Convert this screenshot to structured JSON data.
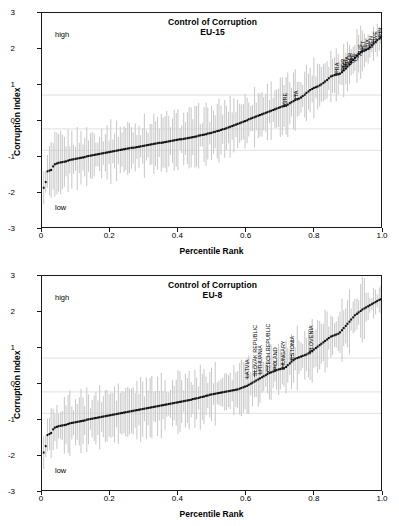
{
  "figure": {
    "width": 399,
    "height": 526,
    "background": "#ffffff",
    "marker_color": "#101010",
    "errorbar_color": "#c9c9c9",
    "grid_color": "#d8d8d8",
    "axis_color": "#1a1a1a"
  },
  "panels": [
    {
      "id": "eu15",
      "title_line1": "Control of Corruption",
      "title_line2": "EU-15",
      "note_high": "high",
      "note_low": "low",
      "xlabel": "Percentile Rank",
      "ylabel": "Corruption Index",
      "xticks": [
        "0",
        "0.2",
        "0.4",
        "0.6",
        "0.8",
        "1.0"
      ],
      "yticks": [
        "3",
        "2",
        "1",
        "0",
        "-1",
        "-2",
        "-3"
      ]
    },
    {
      "id": "eu8",
      "title_line1": "Control of Corruption",
      "title_line2": "EU-8",
      "note_high": "high",
      "note_low": "low",
      "xlabel": "Percentile Rank",
      "ylabel": "Corruption Index",
      "xticks": [
        "0",
        "0.2",
        "0.4",
        "0.6",
        "0.8",
        "1.0"
      ],
      "yticks": [
        "3",
        "2",
        "1",
        "0",
        "-1",
        "-2",
        "-3"
      ]
    }
  ],
  "chart_data": [
    {
      "type": "scatter",
      "id": "eu15",
      "title": "Control of Corruption EU-15",
      "xlabel": "Percentile Rank",
      "ylabel": "Corruption Index",
      "xlim": [
        0.0,
        1.0
      ],
      "ylim": [
        -3,
        3
      ],
      "xticks": [
        0,
        0.2,
        0.4,
        0.6,
        0.8,
        1.0
      ],
      "yticks": [
        3,
        2,
        1,
        0,
        -1,
        -2,
        -3
      ],
      "grid": true,
      "gridlines_y": [
        0.7,
        -0.25,
        -0.85
      ],
      "legend": "none",
      "annotations": [
        "high",
        "low"
      ],
      "series_name": "Corruption Index point estimate (sorted by percentile rank)",
      "errorbars": "90% confidence interval, light gray vertical lines",
      "x": [
        0.005,
        0.011,
        0.016,
        0.022,
        0.027,
        0.033,
        0.038,
        0.044,
        0.049,
        0.055,
        0.06,
        0.066,
        0.071,
        0.077,
        0.082,
        0.088,
        0.093,
        0.099,
        0.104,
        0.11,
        0.115,
        0.121,
        0.126,
        0.132,
        0.137,
        0.143,
        0.148,
        0.154,
        0.159,
        0.165,
        0.17,
        0.176,
        0.181,
        0.187,
        0.192,
        0.198,
        0.203,
        0.209,
        0.214,
        0.22,
        0.225,
        0.231,
        0.236,
        0.242,
        0.247,
        0.253,
        0.258,
        0.264,
        0.269,
        0.275,
        0.28,
        0.286,
        0.291,
        0.297,
        0.302,
        0.308,
        0.313,
        0.319,
        0.324,
        0.33,
        0.335,
        0.341,
        0.346,
        0.352,
        0.357,
        0.363,
        0.368,
        0.374,
        0.379,
        0.385,
        0.39,
        0.396,
        0.401,
        0.407,
        0.412,
        0.418,
        0.423,
        0.429,
        0.434,
        0.44,
        0.445,
        0.451,
        0.456,
        0.462,
        0.467,
        0.473,
        0.478,
        0.484,
        0.489,
        0.495,
        0.5,
        0.506,
        0.511,
        0.517,
        0.522,
        0.528,
        0.533,
        0.539,
        0.544,
        0.55,
        0.555,
        0.561,
        0.566,
        0.572,
        0.577,
        0.583,
        0.588,
        0.594,
        0.599,
        0.605,
        0.61,
        0.616,
        0.621,
        0.627,
        0.632,
        0.638,
        0.643,
        0.649,
        0.654,
        0.66,
        0.665,
        0.671,
        0.676,
        0.682,
        0.687,
        0.692,
        0.698,
        0.703,
        0.709,
        0.714,
        0.72,
        0.725,
        0.731,
        0.736,
        0.742,
        0.747,
        0.753,
        0.758,
        0.764,
        0.769,
        0.775,
        0.78,
        0.786,
        0.791,
        0.797,
        0.802,
        0.808,
        0.813,
        0.819,
        0.824,
        0.83,
        0.835,
        0.841,
        0.846,
        0.852,
        0.857,
        0.863,
        0.868,
        0.874,
        0.879,
        0.885,
        0.89,
        0.896,
        0.901,
        0.907,
        0.912,
        0.918,
        0.923,
        0.929,
        0.934,
        0.94,
        0.945,
        0.951,
        0.956,
        0.962,
        0.967,
        0.973,
        0.978,
        0.984,
        0.989,
        0.995,
        1.0
      ],
      "y": [
        -1.9,
        -1.74,
        -1.44,
        -1.42,
        -1.4,
        -1.3,
        -1.24,
        -1.22,
        -1.2,
        -1.19,
        -1.18,
        -1.17,
        -1.16,
        -1.14,
        -1.12,
        -1.11,
        -1.1,
        -1.09,
        -1.08,
        -1.07,
        -1.06,
        -1.05,
        -1.04,
        -1.02,
        -1.01,
        -1.0,
        -0.99,
        -0.98,
        -0.97,
        -0.96,
        -0.95,
        -0.94,
        -0.93,
        -0.92,
        -0.91,
        -0.9,
        -0.89,
        -0.88,
        -0.87,
        -0.86,
        -0.85,
        -0.84,
        -0.83,
        -0.82,
        -0.81,
        -0.8,
        -0.79,
        -0.78,
        -0.78,
        -0.77,
        -0.76,
        -0.75,
        -0.74,
        -0.73,
        -0.72,
        -0.71,
        -0.7,
        -0.69,
        -0.68,
        -0.67,
        -0.66,
        -0.65,
        -0.64,
        -0.64,
        -0.63,
        -0.62,
        -0.61,
        -0.6,
        -0.59,
        -0.58,
        -0.57,
        -0.56,
        -0.55,
        -0.54,
        -0.54,
        -0.53,
        -0.52,
        -0.51,
        -0.5,
        -0.49,
        -0.48,
        -0.47,
        -0.46,
        -0.44,
        -0.43,
        -0.42,
        -0.41,
        -0.4,
        -0.38,
        -0.37,
        -0.36,
        -0.34,
        -0.33,
        -0.31,
        -0.3,
        -0.28,
        -0.26,
        -0.25,
        -0.23,
        -0.21,
        -0.19,
        -0.17,
        -0.15,
        -0.13,
        -0.11,
        -0.09,
        -0.07,
        -0.05,
        -0.03,
        -0.01,
        0.02,
        0.04,
        0.06,
        0.08,
        0.1,
        0.12,
        0.14,
        0.16,
        0.18,
        0.2,
        0.22,
        0.24,
        0.26,
        0.28,
        0.3,
        0.32,
        0.34,
        0.36,
        0.38,
        0.39,
        0.4,
        0.43,
        0.47,
        0.5,
        0.53,
        0.56,
        0.58,
        0.6,
        0.63,
        0.67,
        0.71,
        0.76,
        0.8,
        0.84,
        0.87,
        0.9,
        0.92,
        0.94,
        0.97,
        1.0,
        1.04,
        1.08,
        1.12,
        1.17,
        1.22,
        1.24,
        1.26,
        1.27,
        1.28,
        1.3,
        1.34,
        1.39,
        1.44,
        1.5,
        1.56,
        1.62,
        1.68,
        1.74,
        1.8,
        1.86,
        1.9,
        1.93,
        1.95,
        1.97,
        2.0,
        2.04,
        2.09,
        2.14,
        2.19,
        2.24,
        2.28,
        2.31
      ],
      "country_labels": [
        {
          "code": "GRE",
          "x": 0.714,
          "y": 0.4
        },
        {
          "code": "ITA",
          "x": 0.747,
          "y": 0.55
        },
        {
          "code": "FRA",
          "x": 0.868,
          "y": 1.24
        },
        {
          "code": "POR",
          "x": 0.885,
          "y": 1.34
        },
        {
          "code": "BEL",
          "x": 0.89,
          "y": 1.39
        },
        {
          "code": "SPA",
          "x": 0.896,
          "y": 1.44
        },
        {
          "code": "GER",
          "x": 0.907,
          "y": 1.5
        },
        {
          "code": "IRE",
          "x": 0.912,
          "y": 1.56
        },
        {
          "code": "UK",
          "x": 0.923,
          "y": 1.62
        },
        {
          "code": "AUS",
          "x": 0.934,
          "y": 1.74
        },
        {
          "code": "NET",
          "x": 0.945,
          "y": 1.86
        },
        {
          "code": "LUX",
          "x": 0.956,
          "y": 1.93
        },
        {
          "code": "DEN",
          "x": 0.967,
          "y": 1.97
        },
        {
          "code": "SWE",
          "x": 0.978,
          "y": 2.09
        },
        {
          "code": "FIN",
          "x": 0.995,
          "y": 2.28
        }
      ]
    },
    {
      "type": "scatter",
      "id": "eu8",
      "title": "Control of Corruption EU-8",
      "xlabel": "Percentile Rank",
      "ylabel": "Corruption Index",
      "xlim": [
        0.0,
        1.0
      ],
      "ylim": [
        -3,
        3
      ],
      "xticks": [
        0,
        0.2,
        0.4,
        0.6,
        0.8,
        1.0
      ],
      "yticks": [
        3,
        2,
        1,
        0,
        -1,
        -2,
        -3
      ],
      "grid": true,
      "gridlines_y": [
        0.7,
        -0.25,
        -0.85
      ],
      "legend": "none",
      "annotations": [
        "high",
        "low"
      ],
      "series_name": "Corruption Index point estimate (sorted by percentile rank)",
      "errorbars": "90% confidence interval, light gray vertical lines",
      "x": [
        0.005,
        0.011,
        0.016,
        0.022,
        0.027,
        0.033,
        0.038,
        0.044,
        0.049,
        0.055,
        0.06,
        0.066,
        0.071,
        0.077,
        0.082,
        0.088,
        0.093,
        0.099,
        0.104,
        0.11,
        0.115,
        0.121,
        0.126,
        0.132,
        0.137,
        0.143,
        0.148,
        0.154,
        0.159,
        0.165,
        0.17,
        0.176,
        0.181,
        0.187,
        0.192,
        0.198,
        0.203,
        0.209,
        0.214,
        0.22,
        0.225,
        0.231,
        0.236,
        0.242,
        0.247,
        0.253,
        0.258,
        0.264,
        0.269,
        0.275,
        0.28,
        0.286,
        0.291,
        0.297,
        0.302,
        0.308,
        0.313,
        0.319,
        0.324,
        0.33,
        0.335,
        0.341,
        0.346,
        0.352,
        0.357,
        0.363,
        0.368,
        0.374,
        0.379,
        0.385,
        0.39,
        0.396,
        0.401,
        0.407,
        0.412,
        0.418,
        0.423,
        0.429,
        0.434,
        0.44,
        0.445,
        0.451,
        0.456,
        0.462,
        0.467,
        0.473,
        0.478,
        0.484,
        0.489,
        0.495,
        0.5,
        0.506,
        0.511,
        0.517,
        0.522,
        0.528,
        0.533,
        0.539,
        0.544,
        0.55,
        0.555,
        0.561,
        0.566,
        0.572,
        0.577,
        0.583,
        0.588,
        0.594,
        0.599,
        0.605,
        0.61,
        0.616,
        0.621,
        0.627,
        0.632,
        0.638,
        0.643,
        0.649,
        0.654,
        0.66,
        0.665,
        0.671,
        0.676,
        0.682,
        0.687,
        0.692,
        0.698,
        0.703,
        0.709,
        0.714,
        0.72,
        0.725,
        0.731,
        0.736,
        0.742,
        0.747,
        0.753,
        0.758,
        0.764,
        0.769,
        0.775,
        0.78,
        0.786,
        0.791,
        0.797,
        0.802,
        0.808,
        0.813,
        0.819,
        0.824,
        0.83,
        0.835,
        0.841,
        0.846,
        0.852,
        0.857,
        0.863,
        0.868,
        0.874,
        0.879,
        0.885,
        0.89,
        0.896,
        0.901,
        0.907,
        0.912,
        0.918,
        0.923,
        0.929,
        0.934,
        0.94,
        0.945,
        0.951,
        0.956,
        0.962,
        0.967,
        0.973,
        0.978,
        0.984,
        0.989,
        0.995,
        1.0
      ],
      "y": [
        -1.95,
        -1.77,
        -1.46,
        -1.43,
        -1.4,
        -1.3,
        -1.25,
        -1.23,
        -1.21,
        -1.2,
        -1.19,
        -1.18,
        -1.17,
        -1.15,
        -1.13,
        -1.12,
        -1.11,
        -1.1,
        -1.09,
        -1.08,
        -1.07,
        -1.06,
        -1.05,
        -1.03,
        -1.02,
        -1.01,
        -1.0,
        -0.99,
        -0.98,
        -0.97,
        -0.96,
        -0.95,
        -0.94,
        -0.93,
        -0.92,
        -0.91,
        -0.9,
        -0.89,
        -0.88,
        -0.87,
        -0.86,
        -0.85,
        -0.84,
        -0.83,
        -0.82,
        -0.81,
        -0.8,
        -0.79,
        -0.78,
        -0.77,
        -0.76,
        -0.75,
        -0.74,
        -0.73,
        -0.72,
        -0.71,
        -0.7,
        -0.69,
        -0.68,
        -0.67,
        -0.66,
        -0.65,
        -0.64,
        -0.63,
        -0.62,
        -0.61,
        -0.6,
        -0.59,
        -0.58,
        -0.57,
        -0.56,
        -0.55,
        -0.54,
        -0.53,
        -0.52,
        -0.51,
        -0.5,
        -0.49,
        -0.48,
        -0.47,
        -0.45,
        -0.44,
        -0.43,
        -0.42,
        -0.4,
        -0.39,
        -0.38,
        -0.36,
        -0.35,
        -0.33,
        -0.32,
        -0.31,
        -0.3,
        -0.29,
        -0.28,
        -0.27,
        -0.26,
        -0.25,
        -0.24,
        -0.23,
        -0.22,
        -0.21,
        -0.2,
        -0.19,
        -0.18,
        -0.16,
        -0.14,
        -0.12,
        -0.1,
        -0.08,
        -0.05,
        -0.02,
        0.01,
        0.04,
        0.07,
        0.1,
        0.13,
        0.16,
        0.19,
        0.22,
        0.25,
        0.28,
        0.3,
        0.32,
        0.34,
        0.36,
        0.38,
        0.39,
        0.4,
        0.41,
        0.45,
        0.5,
        0.55,
        0.6,
        0.64,
        0.68,
        0.7,
        0.72,
        0.74,
        0.76,
        0.78,
        0.8,
        0.83,
        0.86,
        0.9,
        0.94,
        0.98,
        1.02,
        1.06,
        1.1,
        1.14,
        1.18,
        1.22,
        1.26,
        1.3,
        1.32,
        1.34,
        1.36,
        1.38,
        1.42,
        1.48,
        1.54,
        1.6,
        1.66,
        1.72,
        1.78,
        1.84,
        1.9,
        1.94,
        1.98,
        2.02,
        2.06,
        2.09,
        2.12,
        2.15,
        2.18,
        2.21,
        2.24,
        2.27,
        2.3,
        2.33,
        2.35
      ],
      "country_labels": [
        {
          "code": "LATVIA",
          "x": 0.605,
          "y": 0.1
        },
        {
          "code": "SLOVAK REPUBLIC",
          "x": 0.627,
          "y": 0.16
        },
        {
          "code": "LITHUANIA",
          "x": 0.643,
          "y": 0.22
        },
        {
          "code": "CZECH REPUBLIC",
          "x": 0.665,
          "y": 0.28
        },
        {
          "code": "POLAND",
          "x": 0.687,
          "y": 0.34
        },
        {
          "code": "HUNGARY",
          "x": 0.709,
          "y": 0.4
        },
        {
          "code": "ESTONIA",
          "x": 0.736,
          "y": 0.6
        },
        {
          "code": "SLOVENIA",
          "x": 0.791,
          "y": 0.8
        }
      ]
    }
  ]
}
